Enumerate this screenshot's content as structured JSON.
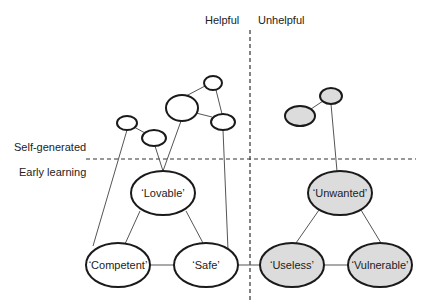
{
  "colors": {
    "helpful_fill": "#ffffff",
    "unhelpful_fill": "#dcdcdc",
    "stroke": "#1a1a1a",
    "edge": "#555555"
  },
  "quadrant_labels": {
    "helpful": "Helpful",
    "unhelpful": "Unhelpful",
    "self_generated": "Self-generated",
    "early_learning": "Early learning"
  },
  "nodes": {
    "lovable": "‘Lovable’",
    "competent": "‘Competent’",
    "safe": "‘Safe’",
    "unwanted": "‘Unwanted’",
    "useless": "‘Useless’",
    "vulnerable": "‘Vulnerable’"
  }
}
